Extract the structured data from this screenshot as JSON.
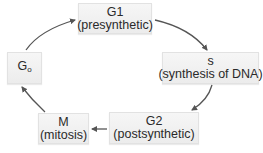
{
  "diagram": {
    "type": "cell-cycle",
    "nodes": [
      {
        "id": "g1",
        "title": "G1",
        "subtitle": "(presynthetic)"
      },
      {
        "id": "s",
        "title": "s",
        "subtitle": "(synthesis of DNA)"
      },
      {
        "id": "g2",
        "title": "G2",
        "subtitle": "(postsynthetic)"
      },
      {
        "id": "m",
        "title": "M",
        "subtitle": "(mitosis)"
      },
      {
        "id": "g0",
        "title_main": "G",
        "title_sub": "o"
      }
    ],
    "edges": [
      {
        "from": "g1",
        "to": "s"
      },
      {
        "from": "s",
        "to": "g2"
      },
      {
        "from": "g2",
        "to": "m"
      },
      {
        "from": "m",
        "to": "g0"
      },
      {
        "from": "g0",
        "to": "g1"
      }
    ],
    "colors": {
      "box_fill": "#efefef",
      "box_border": "#e2e2e2",
      "arrow": "#555555",
      "text": "#2a2a2a"
    }
  }
}
